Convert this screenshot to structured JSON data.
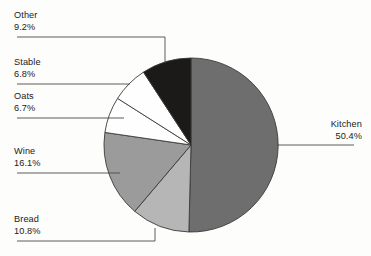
{
  "chart_data": {
    "type": "pie",
    "title": "",
    "subtitle": "",
    "xlabel": "",
    "ylabel": "",
    "grid": false,
    "legend_position": "callout-labels",
    "start_angle_deg": 0,
    "direction": "clockwise",
    "center": {
      "x": 191,
      "y": 145
    },
    "radius": 87,
    "categories": [
      "Kitchen",
      "Bread",
      "Wine",
      "Oats",
      "Stable",
      "Other"
    ],
    "values": [
      50.4,
      10.8,
      16.1,
      6.7,
      6.8,
      9.2
    ],
    "value_unit": "%",
    "slices": [
      {
        "label": "Kitchen",
        "pct_text": "50.4%",
        "value": 50.4,
        "color": "#6e6e6e",
        "start_deg": 0.0,
        "end_deg": 181.4
      },
      {
        "label": "Bread",
        "pct_text": "10.8%",
        "value": 10.8,
        "color": "#b6b6b6",
        "start_deg": 181.4,
        "end_deg": 220.3
      },
      {
        "label": "Wine",
        "pct_text": "16.1%",
        "value": 16.1,
        "color": "#9b9b9b",
        "start_deg": 220.3,
        "end_deg": 278.3
      },
      {
        "label": "Oats",
        "pct_text": "6.7%",
        "value": 6.7,
        "color": "#fefefe",
        "start_deg": 278.3,
        "end_deg": 302.4
      },
      {
        "label": "Stable",
        "pct_text": "6.8%",
        "value": 6.8,
        "color": "#fefefe",
        "start_deg": 302.4,
        "end_deg": 326.9
      },
      {
        "label": "Other",
        "pct_text": "9.2%",
        "value": 9.2,
        "color": "#1c1a18",
        "start_deg": 326.9,
        "end_deg": 360.0
      }
    ],
    "colors": {
      "background": "#fdfdfb",
      "outline": "#3a3a3a",
      "leader": "#4a4a4a",
      "text": "#1b1b1b"
    }
  },
  "callouts": {
    "kitchen": {
      "name": "Kitchen",
      "pct": "50.4%"
    },
    "bread": {
      "name": "Bread",
      "pct": "10.8%"
    },
    "wine": {
      "name": "Wine",
      "pct": "16.1%"
    },
    "oats": {
      "name": "Oats",
      "pct": "6.7%"
    },
    "stable": {
      "name": "Stable",
      "pct": "6.8%"
    },
    "other": {
      "name": "Other",
      "pct": "9.2%"
    }
  }
}
